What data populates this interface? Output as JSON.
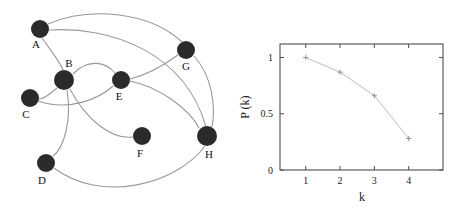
{
  "figure": {
    "background": "#ffffff",
    "panels": [
      "network-graph",
      "degree-distribution-plot"
    ]
  },
  "graph": {
    "node_color": "#2b2b2b",
    "edge_color": "#999999",
    "nodes": [
      {
        "id": "A",
        "label": "A",
        "cx": 40,
        "cy": 29,
        "r": 9,
        "label_x": 36,
        "label_y": 48
      },
      {
        "id": "B",
        "label": "B",
        "cx": 64,
        "cy": 80,
        "r": 10,
        "label_x": 69,
        "label_y": 67
      },
      {
        "id": "C",
        "label": "C",
        "cx": 30,
        "cy": 98,
        "r": 9,
        "label_x": 26,
        "label_y": 118
      },
      {
        "id": "D",
        "label": "D",
        "cx": 46,
        "cy": 163,
        "r": 9,
        "label_x": 42,
        "label_y": 184
      },
      {
        "id": "E",
        "label": "E",
        "cx": 121,
        "cy": 80,
        "r": 9,
        "label_x": 119,
        "label_y": 100
      },
      {
        "id": "F",
        "label": "F",
        "cx": 142,
        "cy": 136,
        "r": 9,
        "label_x": 140,
        "label_y": 157
      },
      {
        "id": "G",
        "label": "G",
        "cx": 186,
        "cy": 50,
        "r": 9,
        "label_x": 186,
        "label_y": 70
      },
      {
        "id": "H",
        "label": "H",
        "cx": 207,
        "cy": 136,
        "r": 10,
        "label_x": 209,
        "label_y": 158
      }
    ],
    "edges": [
      {
        "from": "A",
        "to": "G",
        "path": "M 48 24 C 90 6 150 12 182 42"
      },
      {
        "from": "A",
        "to": "H",
        "path": "M 49 30 C 110 26 185 52 206 127"
      },
      {
        "from": "A",
        "to": "B",
        "path": "M 42 38 C 52 52 60 62 63 70"
      },
      {
        "from": "B",
        "to": "E",
        "path": "M 73 74 C 88 58 106 62 115 73"
      },
      {
        "from": "B",
        "to": "C",
        "path": "M 57 88 C 48 96 42 99 39 99"
      },
      {
        "from": "B",
        "to": "F",
        "path": "M 70 89 C 86 120 112 140 133 137"
      },
      {
        "from": "B",
        "to": "D",
        "path": "M 67 90 C 72 120 64 148 53 156"
      },
      {
        "from": "C",
        "to": "E",
        "path": "M 38 101 C 70 112 100 98 113 86"
      },
      {
        "from": "E",
        "to": "H",
        "path": "M 130 81 C 160 87 190 110 199 128"
      },
      {
        "from": "G",
        "to": "E",
        "path": "M 178 55 C 160 68 142 76 130 79"
      },
      {
        "from": "G",
        "to": "H",
        "path": "M 194 56 C 212 76 216 106 212 127"
      },
      {
        "from": "D",
        "to": "H",
        "path": "M 54 168 C 100 203 175 186 205 146"
      }
    ]
  },
  "chart_data": {
    "type": "line",
    "title": "",
    "xlabel": "k",
    "ylabel": "P (k)",
    "x": [
      1,
      2,
      3,
      4
    ],
    "values": [
      1.0,
      0.87,
      0.66,
      0.28
    ],
    "series": [
      {
        "name": "P(k)",
        "values": [
          1.0,
          0.87,
          0.66,
          0.28
        ]
      }
    ],
    "xticks": [
      1,
      2,
      3,
      4
    ],
    "xtick_labels": [
      "1",
      "2",
      "3",
      "4"
    ],
    "yticks": [
      0,
      0.5,
      1
    ],
    "ytick_labels": [
      "0",
      "0.5",
      "1"
    ],
    "xlim": [
      0.25,
      5.0
    ],
    "ylim": [
      0.0,
      1.12
    ],
    "grid": false,
    "legend": false,
    "line_color": "#bdbdbd",
    "marker_color": "#8a8a8a",
    "marker": "plus",
    "axis_color": "#4d4d4d"
  },
  "chart_labels": {
    "xlabel": "k",
    "ylabel": "P (k)",
    "x_ticks": [
      "1",
      "2",
      "3",
      "4"
    ],
    "y_ticks": [
      "0",
      "0.5",
      "1"
    ]
  }
}
